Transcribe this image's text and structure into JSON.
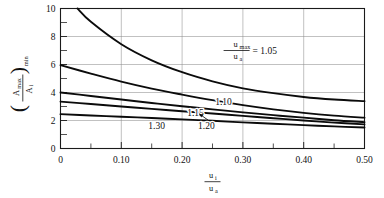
{
  "chart_data": {
    "type": "line",
    "title": "",
    "subtitle": "",
    "xlabel_numerator": "u",
    "xlabel_numerator_sub": "i",
    "xlabel_denominator": "u",
    "xlabel_denominator_sub": "a",
    "ylabel_numerator": "A",
    "ylabel_numerator_sub": "max",
    "ylabel_denominator": "A",
    "ylabel_denominator_sub": "i",
    "ylabel_outer_sub": "min",
    "xlim": [
      0,
      0.5
    ],
    "ylim": [
      0,
      10
    ],
    "x_ticks": [
      0,
      0.1,
      0.2,
      0.3,
      0.4,
      0.5
    ],
    "x_tick_labels": [
      "0",
      "0.10",
      "0.20",
      "0.30",
      "0.40",
      "0.50"
    ],
    "x_minor_ticks": [
      0.05,
      0.15,
      0.25,
      0.35,
      0.45
    ],
    "y_ticks": [
      0,
      2,
      4,
      6,
      8,
      10
    ],
    "y_tick_labels": [
      "0",
      "2",
      "4",
      "6",
      "8",
      "10"
    ],
    "y_minor_ticks": [
      1,
      3,
      5,
      7,
      9
    ],
    "grid": true,
    "grid_x": [
      0.1,
      0.2,
      0.3,
      0.4,
      0.5
    ],
    "grid_y": [
      2,
      4,
      6,
      8,
      10
    ],
    "legend_position": "inline-curve-labels",
    "legend_key_label": "1.05",
    "series": [
      {
        "name": "1.05",
        "label": "1.05",
        "label_x": 0.288,
        "label_y": 7.1,
        "points": [
          {
            "x": 0.028,
            "y": 10.0
          },
          {
            "x": 0.05,
            "y": 9.05
          },
          {
            "x": 0.1,
            "y": 7.45
          },
          {
            "x": 0.15,
            "y": 6.3
          },
          {
            "x": 0.2,
            "y": 5.45
          },
          {
            "x": 0.25,
            "y": 4.8
          },
          {
            "x": 0.3,
            "y": 4.3
          },
          {
            "x": 0.35,
            "y": 3.95
          },
          {
            "x": 0.4,
            "y": 3.68
          },
          {
            "x": 0.45,
            "y": 3.5
          },
          {
            "x": 0.5,
            "y": 3.38
          }
        ]
      },
      {
        "name": "1.10",
        "label": "1.10",
        "label_x": 0.268,
        "label_y": 3.35,
        "points": [
          {
            "x": 0.0,
            "y": 5.95
          },
          {
            "x": 0.05,
            "y": 5.35
          },
          {
            "x": 0.1,
            "y": 4.78
          },
          {
            "x": 0.15,
            "y": 4.28
          },
          {
            "x": 0.2,
            "y": 3.85
          },
          {
            "x": 0.25,
            "y": 3.45
          },
          {
            "x": 0.3,
            "y": 3.1
          },
          {
            "x": 0.35,
            "y": 2.8
          },
          {
            "x": 0.4,
            "y": 2.55
          },
          {
            "x": 0.45,
            "y": 2.35
          },
          {
            "x": 0.5,
            "y": 2.2
          }
        ]
      },
      {
        "name": "1.15",
        "label": "1.15",
        "label_x": 0.222,
        "label_y": 2.6,
        "points": [
          {
            "x": 0.0,
            "y": 4.0
          },
          {
            "x": 0.05,
            "y": 3.75
          },
          {
            "x": 0.1,
            "y": 3.5
          },
          {
            "x": 0.15,
            "y": 3.25
          },
          {
            "x": 0.2,
            "y": 3.02
          },
          {
            "x": 0.25,
            "y": 2.8
          },
          {
            "x": 0.3,
            "y": 2.58
          },
          {
            "x": 0.35,
            "y": 2.38
          },
          {
            "x": 0.4,
            "y": 2.2
          },
          {
            "x": 0.45,
            "y": 2.02
          },
          {
            "x": 0.5,
            "y": 1.88
          }
        ]
      },
      {
        "name": "1.20",
        "label": "1.20",
        "label_x": 0.24,
        "label_y": 1.62,
        "points": [
          {
            "x": 0.0,
            "y": 3.35
          },
          {
            "x": 0.05,
            "y": 3.18
          },
          {
            "x": 0.1,
            "y": 3.0
          },
          {
            "x": 0.15,
            "y": 2.83
          },
          {
            "x": 0.2,
            "y": 2.66
          },
          {
            "x": 0.25,
            "y": 2.5
          },
          {
            "x": 0.3,
            "y": 2.33
          },
          {
            "x": 0.35,
            "y": 2.16
          },
          {
            "x": 0.4,
            "y": 2.0
          },
          {
            "x": 0.45,
            "y": 1.85
          },
          {
            "x": 0.5,
            "y": 1.72
          }
        ]
      },
      {
        "name": "1.30",
        "label": "1.30",
        "label_x": 0.158,
        "label_y": 1.62,
        "points": [
          {
            "x": 0.0,
            "y": 2.45
          },
          {
            "x": 0.05,
            "y": 2.36
          },
          {
            "x": 0.1,
            "y": 2.27
          },
          {
            "x": 0.15,
            "y": 2.18
          },
          {
            "x": 0.2,
            "y": 2.08
          },
          {
            "x": 0.25,
            "y": 1.98
          },
          {
            "x": 0.3,
            "y": 1.87
          },
          {
            "x": 0.35,
            "y": 1.77
          },
          {
            "x": 0.4,
            "y": 1.67
          },
          {
            "x": 0.45,
            "y": 1.58
          },
          {
            "x": 0.5,
            "y": 1.5
          }
        ]
      }
    ],
    "annotations": [
      {
        "name": "legend-ratio-key",
        "text": "= 1.05",
        "numerator": "u",
        "numerator_sub": "max",
        "denominator": "u",
        "denominator_sub": "a",
        "x": 0.288,
        "y": 7.1
      },
      {
        "name": "pointer-1.20",
        "from_x": 0.243,
        "from_y": 2.02,
        "to_x": 0.228,
        "to_y": 2.48
      }
    ]
  }
}
